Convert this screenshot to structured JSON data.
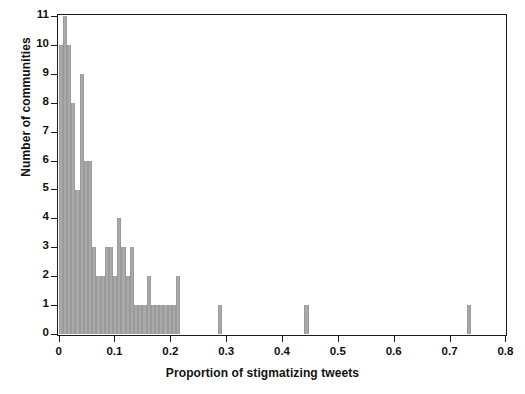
{
  "chart_data": {
    "type": "bar",
    "title": "",
    "subtitle": "",
    "xlabel": "Proportion of stigmatizing tweets",
    "ylabel": "Number of communities",
    "xlim": [
      0,
      0.8
    ],
    "ylim": [
      0,
      11
    ],
    "grid": false,
    "legend": null,
    "bar_color": "#a9a9a9",
    "axis_color": "#1a1a1a",
    "background": "#ffffff",
    "bin_width": 0.0075,
    "xticks": [
      "0",
      "0.1",
      "0.2",
      "0.3",
      "0.4",
      "0.5",
      "0.6",
      "0.7",
      "0.8"
    ],
    "xtick_values": [
      0,
      0.1,
      0.2,
      0.3,
      0.4,
      0.5,
      0.6,
      0.7,
      0.8
    ],
    "yticks": [
      "0",
      "1",
      "2",
      "3",
      "4",
      "5",
      "6",
      "7",
      "8",
      "9",
      "10",
      "11"
    ],
    "ytick_values": [
      0,
      1,
      2,
      3,
      4,
      5,
      6,
      7,
      8,
      9,
      10,
      11
    ],
    "x": [
      0.0038,
      0.0113,
      0.0188,
      0.0263,
      0.0338,
      0.0413,
      0.0488,
      0.0563,
      0.0638,
      0.0713,
      0.0788,
      0.0863,
      0.0938,
      0.1013,
      0.1088,
      0.1163,
      0.1238,
      0.1313,
      0.1388,
      0.1463,
      0.1538,
      0.1613,
      0.1688,
      0.1763,
      0.1838,
      0.1913,
      0.1988,
      0.2063,
      0.2138,
      0.2888,
      0.4438,
      0.735
    ],
    "values": [
      10,
      11,
      10,
      8,
      5,
      9,
      6,
      6,
      3,
      2,
      2,
      3,
      3,
      2,
      4,
      3,
      2,
      3,
      1,
      1,
      1,
      2,
      1,
      1,
      1,
      1,
      1,
      1,
      2,
      1,
      1,
      1
    ],
    "bars": [
      {
        "x": 0.0038,
        "value": 10
      },
      {
        "x": 0.0113,
        "value": 11
      },
      {
        "x": 0.0188,
        "value": 10
      },
      {
        "x": 0.0263,
        "value": 8
      },
      {
        "x": 0.0338,
        "value": 5
      },
      {
        "x": 0.0413,
        "value": 9
      },
      {
        "x": 0.0488,
        "value": 6
      },
      {
        "x": 0.0563,
        "value": 6
      },
      {
        "x": 0.0638,
        "value": 3
      },
      {
        "x": 0.0713,
        "value": 2
      },
      {
        "x": 0.0788,
        "value": 2
      },
      {
        "x": 0.0863,
        "value": 3
      },
      {
        "x": 0.0938,
        "value": 3
      },
      {
        "x": 0.1013,
        "value": 2
      },
      {
        "x": 0.1088,
        "value": 4
      },
      {
        "x": 0.1163,
        "value": 3
      },
      {
        "x": 0.1238,
        "value": 2
      },
      {
        "x": 0.1313,
        "value": 3
      },
      {
        "x": 0.1388,
        "value": 1
      },
      {
        "x": 0.1463,
        "value": 1
      },
      {
        "x": 0.1538,
        "value": 1
      },
      {
        "x": 0.1613,
        "value": 2
      },
      {
        "x": 0.1688,
        "value": 1
      },
      {
        "x": 0.1763,
        "value": 1
      },
      {
        "x": 0.1838,
        "value": 1
      },
      {
        "x": 0.1913,
        "value": 1
      },
      {
        "x": 0.1988,
        "value": 1
      },
      {
        "x": 0.2063,
        "value": 1
      },
      {
        "x": 0.2138,
        "value": 2
      },
      {
        "x": 0.2888,
        "value": 1
      },
      {
        "x": 0.4438,
        "value": 1
      },
      {
        "x": 0.735,
        "value": 1
      }
    ]
  }
}
